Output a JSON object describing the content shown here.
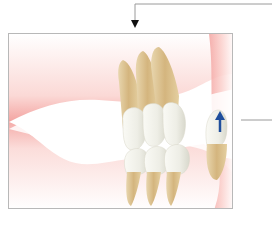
{
  "figure": {
    "type": "dental-illustration",
    "annotations": [
      {
        "kind": "callout-arrow",
        "direction": "down",
        "position": "top-center"
      },
      {
        "kind": "callout-line",
        "position": "right-middle"
      },
      {
        "kind": "movement-arrow",
        "direction": "up",
        "color": "#1f4e9c",
        "position": "rightmost-lower-tooth"
      }
    ]
  },
  "colors": {
    "gum": "#f3a3a0",
    "root": "#d9bf8c",
    "crown": "#f1f1ea",
    "frame": "#b8b8b8",
    "arrow": "#1f4e9c",
    "leader": "#9a9a9a"
  }
}
